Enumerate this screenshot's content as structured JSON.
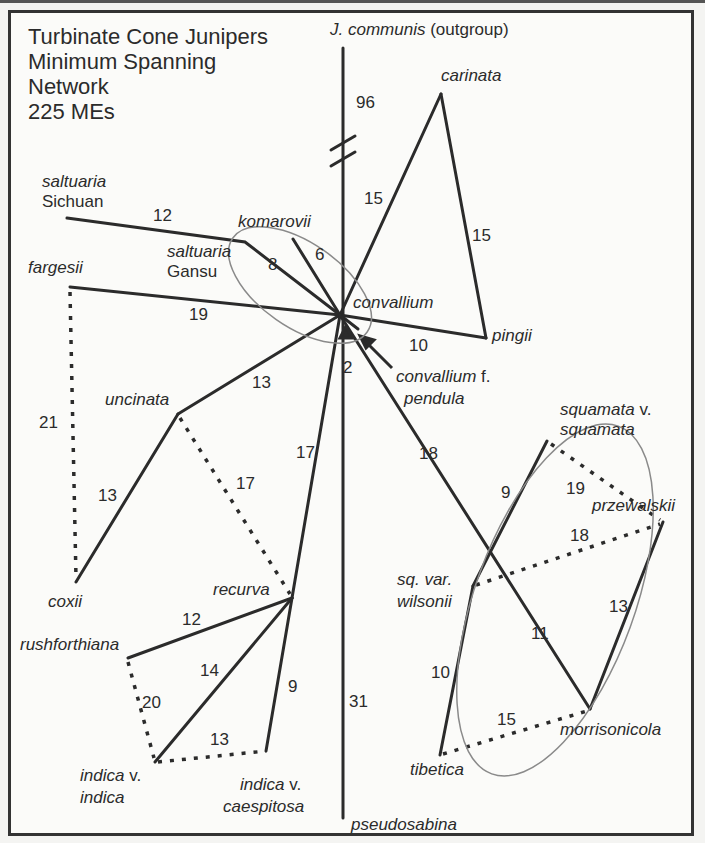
{
  "title": {
    "line1": "Turbinate Cone Junipers",
    "line2": "Minimum Spanning",
    "line3": "Network",
    "line4": "225 MEs"
  },
  "taxa": {
    "communis": "J. communis",
    "communis_suffix": " (outgroup)",
    "carinata": "carinata",
    "saltuaria_sichuan_1": "saltuaria",
    "saltuaria_sichuan_2": "Sichuan",
    "komarovii": "komarovii",
    "saltuaria_gansu_1": "saltuaria",
    "saltuaria_gansu_2": "Gansu",
    "fargesii": "fargesii",
    "convallium": "convallium",
    "pingii": "pingii",
    "convallium_pendula_1": "convallium",
    "convallium_pendula_f": " f.",
    "convallium_pendula_2": "pendula",
    "uncinata": "uncinata",
    "coxii": "coxii",
    "recurva": "recurva",
    "rushforthiana": "rushforthiana",
    "indica_indica_1": "indica",
    "indica_indica_v": " v.",
    "indica_indica_2": "indica",
    "indica_caespitosa_1": "indica",
    "indica_caespitosa_v": " v.",
    "indica_caespitosa_2": "caespitosa",
    "squamata_1": "squamata",
    "squamata_v": " v.",
    "squamata_2": "squamata",
    "przewalskii": "przewalskii",
    "wilsonii_1": "sq. var.",
    "wilsonii_2": "wilsonii",
    "morrisonicola": "morrisonicola",
    "tibetica": "tibetica",
    "pseudosabina": "pseudosabina"
  },
  "edges": [
    {
      "from": "convallium",
      "to": "J. communis",
      "value": "96",
      "style": "solid",
      "broken": true
    },
    {
      "from": "convallium",
      "to": "carinata",
      "value": "15",
      "style": "solid"
    },
    {
      "from": "carinata",
      "to": "pingii",
      "value": "15",
      "style": "solid"
    },
    {
      "from": "convallium",
      "to": "pingii",
      "value": "10",
      "style": "solid"
    },
    {
      "from": "convallium",
      "to": "saltuaria Sichuan",
      "value": "12",
      "style": "solid"
    },
    {
      "from": "convallium",
      "to": "saltuaria Gansu",
      "value": "8",
      "style": "solid"
    },
    {
      "from": "convallium",
      "to": "komarovii",
      "value": "6",
      "style": "solid"
    },
    {
      "from": "convallium",
      "to": "fargesii",
      "value": "19",
      "style": "solid"
    },
    {
      "from": "convallium",
      "to": "convallium f. pendula",
      "value": "2",
      "style": "solid"
    },
    {
      "from": "convallium",
      "to": "uncinata",
      "value": "13",
      "style": "solid"
    },
    {
      "from": "uncinata",
      "to": "coxii",
      "value": "13",
      "style": "solid"
    },
    {
      "from": "fargesii",
      "to": "coxii",
      "value": "21",
      "style": "dashed"
    },
    {
      "from": "uncinata",
      "to": "recurva",
      "value": "17",
      "style": "dashed"
    },
    {
      "from": "convallium",
      "to": "recurva",
      "value": "17",
      "style": "solid"
    },
    {
      "from": "recurva",
      "to": "rushforthiana",
      "value": "12",
      "style": "solid"
    },
    {
      "from": "recurva",
      "to": "indica v. indica",
      "value": "14",
      "style": "solid"
    },
    {
      "from": "recurva",
      "to": "indica v. caespitosa",
      "value": "9",
      "style": "solid"
    },
    {
      "from": "rushforthiana",
      "to": "indica v. indica",
      "value": "20",
      "style": "dashed"
    },
    {
      "from": "indica v. indica",
      "to": "indica v. caespitosa",
      "value": "13",
      "style": "dashed"
    },
    {
      "from": "convallium",
      "to": "sq. var. wilsonii",
      "value": "18",
      "style": "solid"
    },
    {
      "from": "sq. var. wilsonii",
      "to": "squamata v. squamata",
      "value": "9",
      "style": "solid"
    },
    {
      "from": "squamata v. squamata",
      "to": "przewalskii",
      "value": "19",
      "style": "dashed"
    },
    {
      "from": "sq. var. wilsonii",
      "to": "przewalskii",
      "value": "18",
      "style": "dashed"
    },
    {
      "from": "przewalskii",
      "to": "morrisonicola",
      "value": "13",
      "style": "solid"
    },
    {
      "from": "sq. var. wilsonii",
      "to": "morrisonicola",
      "value": "11",
      "style": "solid"
    },
    {
      "from": "sq. var. wilsonii",
      "to": "tibetica",
      "value": "10",
      "style": "solid"
    },
    {
      "from": "tibetica",
      "to": "morrisonicola",
      "value": "15",
      "style": "dashed"
    },
    {
      "from": "convallium",
      "to": "pseudosabina",
      "value": "31",
      "style": "solid"
    }
  ],
  "colors": {
    "line": "#2b2b2b",
    "ellipse": "#8a8a8a",
    "background": "#fbfbf9",
    "frame": "#333333"
  }
}
